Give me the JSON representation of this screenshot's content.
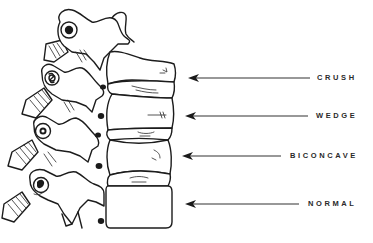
{
  "figure": {
    "labels": [
      {
        "id": "crush",
        "text": "CRUSH",
        "arrow_y": 78,
        "arrow_x1": 188,
        "arrow_x2": 310,
        "text_x": 317
      },
      {
        "id": "wedge",
        "text": "WEDGE",
        "arrow_y": 116,
        "arrow_x1": 185,
        "arrow_x2": 308,
        "text_x": 316
      },
      {
        "id": "biconcave",
        "text": "BICONCAVE",
        "arrow_y": 156,
        "arrow_x1": 182,
        "arrow_x2": 281,
        "text_x": 290
      },
      {
        "id": "normal",
        "text": "NORMAL",
        "arrow_y": 204,
        "arrow_x1": 185,
        "arrow_x2": 299,
        "text_x": 308
      }
    ],
    "colors": {
      "background": "#ffffff",
      "ink": "#1c1c1c",
      "label_text": "#2a2a2a"
    }
  }
}
